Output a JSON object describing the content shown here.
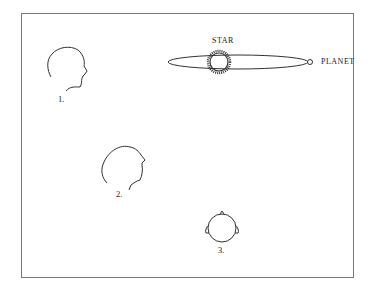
{
  "figures": [
    {
      "id": 1,
      "label": "1.",
      "description": "head profile facing right"
    },
    {
      "id": 2,
      "label": "2.",
      "description": "head profile tilted upward"
    },
    {
      "id": 3,
      "label": "3.",
      "description": "head viewed from above"
    }
  ],
  "orbit": {
    "star_label": "STAR",
    "planet_label": "PLANET"
  },
  "colors": {
    "line": "#333333",
    "frame": "#777777"
  }
}
